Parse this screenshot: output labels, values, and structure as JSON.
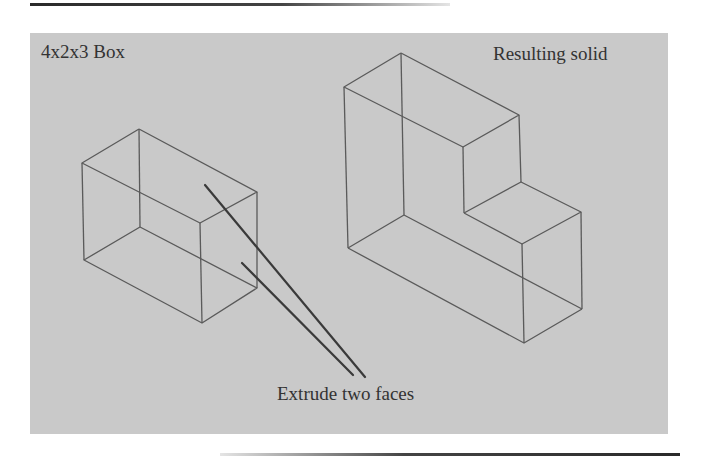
{
  "figure": {
    "labels": {
      "box": "4x2x3 Box",
      "result": "Resulting solid",
      "callout": "Extrude two faces"
    },
    "colors": {
      "panel": "#c9c9c9",
      "edges": "#5a5a5a",
      "leaders": "#3a3a3a",
      "text": "#333333"
    },
    "shapes": [
      {
        "name": "box-wireframe",
        "description": "4x2x3 box wireframe (isometric)"
      },
      {
        "name": "l-shaped-solid-wireframe",
        "description": "Resulting L-shaped solid wireframe (isometric)"
      }
    ],
    "callout_targets": [
      "top face of box",
      "front face of box"
    ]
  }
}
